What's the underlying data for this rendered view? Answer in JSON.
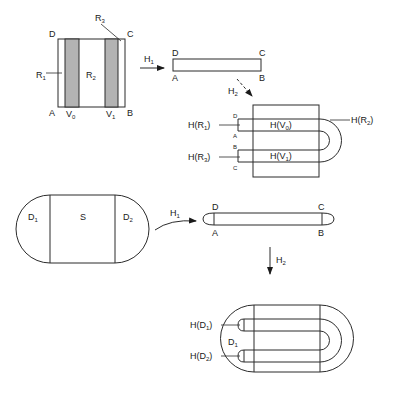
{
  "figure": {
    "panel_top_left": {
      "corners": {
        "D": "D",
        "C": "C",
        "A": "A",
        "B": "B"
      },
      "regions": {
        "R1": "R",
        "R1_sub": "1",
        "R2": "R",
        "R2_sub": "2",
        "R3": "R",
        "R3_sub": "3"
      },
      "strips": {
        "V0": "V",
        "V0_sub": "0",
        "V1": "V",
        "V1_sub": "1"
      }
    },
    "arrow_h1_top": {
      "label": "H",
      "sub": "1"
    },
    "bar_top": {
      "corners": {
        "D": "D",
        "C": "C",
        "A": "A",
        "B": "B"
      }
    },
    "arrow_h2_top": {
      "label": "H",
      "sub": "2"
    },
    "panel_top_right": {
      "labels": {
        "H_R1": "H(R",
        "H_R1_sub": "1",
        "H_R3": "H(R",
        "H_R3_sub": "3",
        "H_R2": "H(R",
        "H_R2_sub": "2",
        "H_V0": "H(V",
        "H_V0_sub": "0",
        "H_V1": "H(V",
        "H_V1_sub": "1",
        "close": ")"
      },
      "corner_marks": {
        "D": "D",
        "A": "A",
        "B": "B",
        "C": "C"
      }
    },
    "panel_bottom_left": {
      "regions": {
        "D1": "D",
        "D1_sub": "1",
        "S": "S",
        "D2": "D",
        "D2_sub": "2"
      }
    },
    "arrow_h1_bottom": {
      "label": "H",
      "sub": "1"
    },
    "bar_bottom": {
      "corners": {
        "D": "D",
        "C": "C",
        "A": "A",
        "B": "B"
      }
    },
    "arrow_h2_bottom": {
      "label": "H",
      "sub": "2"
    },
    "panel_bottom_right": {
      "labels": {
        "H_D1": "H(D",
        "H_D1_sub": "1",
        "H_D2": "H(D",
        "H_D2_sub": "2",
        "D1": "D",
        "D1_sub": "1",
        "close": ")"
      }
    }
  },
  "colors": {
    "stroke": "#2b2b2b",
    "strip_fill": "#b3b3b3",
    "background": "#ffffff"
  }
}
